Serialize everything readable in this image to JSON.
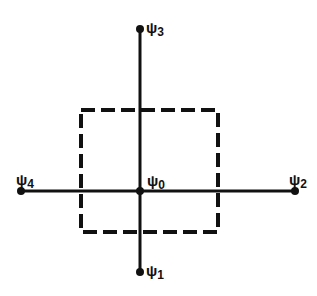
{
  "diagram": {
    "type": "cross-with-dashed-square",
    "colors": {
      "line": "#111111",
      "background": "#ffffff"
    },
    "nodes": [
      {
        "id": "psi0",
        "symbol": "ψ",
        "subscript": "0",
        "x": 140,
        "y": 191,
        "label_x": 147,
        "label_y": 173
      },
      {
        "id": "psi1",
        "symbol": "ψ",
        "subscript": "1",
        "x": 140,
        "y": 272,
        "label_x": 146,
        "label_y": 263
      },
      {
        "id": "psi2",
        "symbol": "ψ",
        "subscript": "2",
        "x": 295,
        "y": 191,
        "label_x": 289,
        "label_y": 172
      },
      {
        "id": "psi3",
        "symbol": "ψ",
        "subscript": "3",
        "x": 140,
        "y": 29,
        "label_x": 146,
        "label_y": 20
      },
      {
        "id": "psi4",
        "symbol": "ψ",
        "subscript": "4",
        "x": 21,
        "y": 191,
        "label_x": 16,
        "label_y": 172
      }
    ],
    "edges": [
      {
        "from": "psi3",
        "to": "psi1",
        "orientation": "vertical"
      },
      {
        "from": "psi4",
        "to": "psi2",
        "orientation": "horizontal"
      }
    ],
    "dashed_box": {
      "x": 81,
      "y": 110,
      "width": 137,
      "height": 122
    }
  }
}
